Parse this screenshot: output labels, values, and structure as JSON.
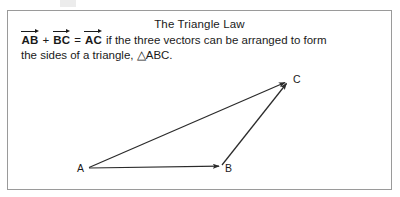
{
  "figure": {
    "title": "The Triangle Law",
    "statement": {
      "vectors": {
        "ab": "AB",
        "bc": "BC",
        "ac": "AC"
      },
      "operator_plus": "+",
      "operator_equals": "=",
      "line1_tail": "if the three vectors can be arranged to form",
      "line2": "the sides of a triangle, △ABC."
    },
    "diagram": {
      "vertices": [
        {
          "label": "A",
          "x": 88,
          "y": 168
        },
        {
          "label": "B",
          "x": 222,
          "y": 166
        },
        {
          "label": "C",
          "x": 288,
          "y": 82
        }
      ],
      "arrows": [
        {
          "name": "vector-ab",
          "from": "A",
          "to": "B"
        },
        {
          "name": "vector-bc",
          "from": "B",
          "to": "C"
        },
        {
          "name": "vector-ac",
          "from": "A",
          "to": "C"
        }
      ]
    },
    "colors": {
      "stroke": "#2b2b2b",
      "border": "#9a9a9a",
      "background": "#ffffff",
      "text": "#1a1a1a"
    }
  }
}
